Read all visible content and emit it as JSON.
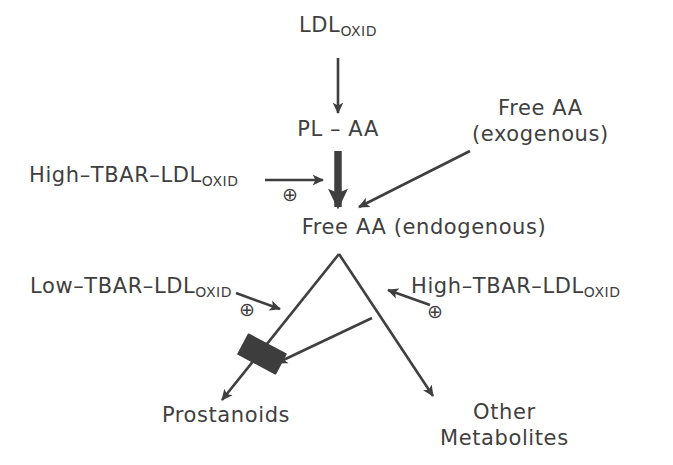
{
  "diagram": {
    "stroke_color": "#3f3f3f",
    "background_color": "#ffffff",
    "block_symbol_color": "#3d3d3d",
    "nodes": {
      "ldl_oxid": {
        "main": "LDL",
        "subscript": "OXID"
      },
      "pl_aa": {
        "main": "PL – AA"
      },
      "free_aa_exogenous": {
        "line1": "Free AA",
        "line2": "(exogenous)"
      },
      "free_aa_endogenous": {
        "main": "Free AA  (endogenous)"
      },
      "high_tbar_left": {
        "main": "High–TBAR–LDL",
        "subscript": "OXID"
      },
      "low_tbar": {
        "main": "Low–TBAR–LDL",
        "subscript": "OXID"
      },
      "high_tbar_right": {
        "main": "High–TBAR–LDL",
        "subscript": "OXID"
      },
      "prostanoids": {
        "main": "Prostanoids"
      },
      "other_metabolites": {
        "line1": "Other",
        "line2": "Metabolites"
      }
    },
    "symbols": {
      "stimulation_1": "⊕",
      "stimulation_2": "⊕",
      "stimulation_3": "⊕"
    },
    "edges": [
      {
        "name": "ldl-oxid-to-pl-aa",
        "from": "LDL_OXID",
        "to": "PL - AA",
        "style": "thin-arrow"
      },
      {
        "name": "pl-aa-to-free-aa",
        "from": "PL - AA",
        "to": "Free AA (endogenous)",
        "style": "bold-arrow"
      },
      {
        "name": "high-tbar-stimulates-release",
        "from": "High-TBAR-LDL_OXID",
        "to": "PL-AA release",
        "style": "thin-arrow",
        "modifier": "⊕"
      },
      {
        "name": "exogenous-aa-to-free-aa",
        "from": "Free AA (exogenous)",
        "to": "Free AA (endogenous)",
        "style": "thin-arrow"
      },
      {
        "name": "free-aa-to-prostanoids",
        "from": "Free AA (endogenous)",
        "to": "Prostanoids",
        "style": "thin-arrow"
      },
      {
        "name": "free-aa-to-other-metabolites",
        "from": "Free AA (endogenous)",
        "to": "Other Metabolites",
        "style": "thin-arrow"
      },
      {
        "name": "low-tbar-stimulates-prostanoids",
        "from": "Low-TBAR-LDL_OXID",
        "to": "prostanoid branch",
        "style": "thin-arrow",
        "modifier": "⊕"
      },
      {
        "name": "high-tbar-stimulates-other",
        "from": "High-TBAR-LDL_OXID",
        "to": "other-metabolites branch",
        "style": "thin-arrow",
        "modifier": "⊕"
      },
      {
        "name": "high-tbar-blocks-prostanoids",
        "from": "other-metabolites branch",
        "to": "prostanoid branch block",
        "style": "thin-arrow-to-block"
      }
    ]
  }
}
